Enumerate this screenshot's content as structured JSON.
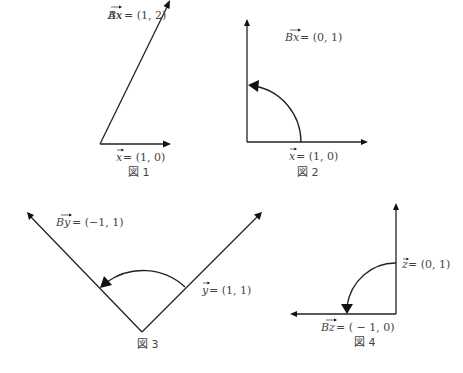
{
  "figures": [
    {
      "id": "fig1",
      "caption": "図 1",
      "vectors": [
        {
          "name": "x",
          "label_vec": "x",
          "label_eq": " = (1, 0)"
        },
        {
          "name": "Ax",
          "label_vec": "Ax",
          "label_eq": " = (1, 2)"
        }
      ]
    },
    {
      "id": "fig2",
      "caption": "図 2",
      "vectors": [
        {
          "name": "x",
          "label_vec": "x",
          "label_eq": " = (1, 0)"
        },
        {
          "name": "Bx",
          "label_vec": "Bx",
          "label_eq": " = (0, 1)"
        }
      ]
    },
    {
      "id": "fig3",
      "caption": "図 3",
      "vectors": [
        {
          "name": "y",
          "label_vec": "y",
          "label_eq": " = (1, 1)"
        },
        {
          "name": "By",
          "label_vec": "By",
          "label_eq": " = (−1, 1)"
        }
      ]
    },
    {
      "id": "fig4",
      "caption": "図 4",
      "vectors": [
        {
          "name": "z",
          "label_vec": "z",
          "label_eq": " = (0, 1)"
        },
        {
          "name": "Bz",
          "label_vec": "Bz",
          "label_eq": " = ( − 1, 0)"
        }
      ]
    }
  ],
  "colors": {
    "stroke": "#222222",
    "text": "#444444",
    "background": "#ffffff"
  }
}
